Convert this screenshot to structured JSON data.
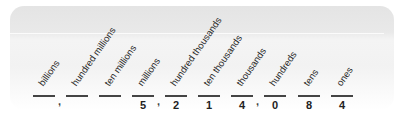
{
  "place_value_chart": {
    "columns": [
      {
        "label": "billions",
        "digit": ""
      },
      {
        "label": "hundred millions",
        "digit": ""
      },
      {
        "label": "ten millions",
        "digit": ""
      },
      {
        "label": "millions",
        "digit": "5"
      },
      {
        "label": "hundred thousands",
        "digit": "2"
      },
      {
        "label": "ten thousands",
        "digit": "1"
      },
      {
        "label": "thousands",
        "digit": "4"
      },
      {
        "label": "hundreds",
        "digit": "0"
      },
      {
        "label": "tens",
        "digit": "8"
      },
      {
        "label": "ones",
        "digit": "4"
      }
    ],
    "separators": [
      ",",
      ",",
      ","
    ]
  }
}
